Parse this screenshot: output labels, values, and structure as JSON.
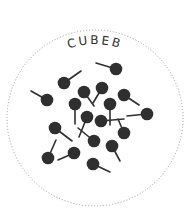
{
  "title": "CUBEB",
  "colors": {
    "ink": "#2f2f2f",
    "border": "#9a9a9a",
    "background": "#ffffff"
  },
  "circle": {
    "cx": 95,
    "cy": 118,
    "r": 88
  },
  "berries": [
    {
      "x": 116,
      "y": 69,
      "sx": 96,
      "sy": 63
    },
    {
      "x": 64,
      "y": 83,
      "sx": 81,
      "sy": 71
    },
    {
      "x": 47,
      "y": 100,
      "sx": 31,
      "sy": 91
    },
    {
      "x": 84,
      "y": 92,
      "sx": 94,
      "sy": 106
    },
    {
      "x": 102,
      "y": 88,
      "sx": 93,
      "sy": 103
    },
    {
      "x": 124,
      "y": 95,
      "sx": 139,
      "sy": 105
    },
    {
      "x": 75,
      "y": 104,
      "sx": 75,
      "sy": 124
    },
    {
      "x": 110,
      "y": 104,
      "sx": 110,
      "sy": 125
    },
    {
      "x": 147,
      "y": 114,
      "sx": 127,
      "sy": 116
    },
    {
      "x": 87,
      "y": 117,
      "sx": 79,
      "sy": 137
    },
    {
      "x": 101,
      "y": 121,
      "sx": 124,
      "sy": 119
    },
    {
      "x": 124,
      "y": 133,
      "sx": 118,
      "sy": 119
    },
    {
      "x": 55,
      "y": 128,
      "sx": 72,
      "sy": 141
    },
    {
      "x": 94,
      "y": 141,
      "sx": 78,
      "sy": 128
    },
    {
      "x": 112,
      "y": 146,
      "sx": 120,
      "sy": 161
    },
    {
      "x": 74,
      "y": 153,
      "sx": 58,
      "sy": 160
    },
    {
      "x": 48,
      "y": 158,
      "sx": 56,
      "sy": 140
    },
    {
      "x": 93,
      "y": 164,
      "sx": 110,
      "sy": 172
    }
  ]
}
